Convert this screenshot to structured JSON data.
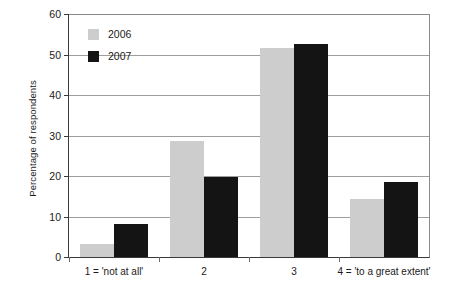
{
  "chart_data": {
    "type": "bar",
    "title": "",
    "subtitle": "",
    "xlabel": "",
    "ylabel": "Percentage of respondents",
    "categories": [
      "1 = 'not at all'",
      "2",
      "3",
      "4 = 'to a great extent'"
    ],
    "series": [
      {
        "name": "2006",
        "color": "#cdcdcd",
        "values": [
          3.1,
          28.6,
          51.5,
          14.3
        ]
      },
      {
        "name": "2007",
        "color": "#141414",
        "values": [
          8.1,
          19.7,
          52.5,
          18.6
        ]
      }
    ],
    "ylim": [
      0,
      60
    ],
    "yticks": [
      0,
      10,
      20,
      30,
      40,
      50,
      60
    ],
    "ytick_labels": [
      "0",
      "10",
      "20",
      "30",
      "40",
      "50",
      "60"
    ],
    "grid": "horizontal",
    "legend_position": "top-left-inside",
    "legend_entries": [
      "2006",
      "2007"
    ]
  }
}
